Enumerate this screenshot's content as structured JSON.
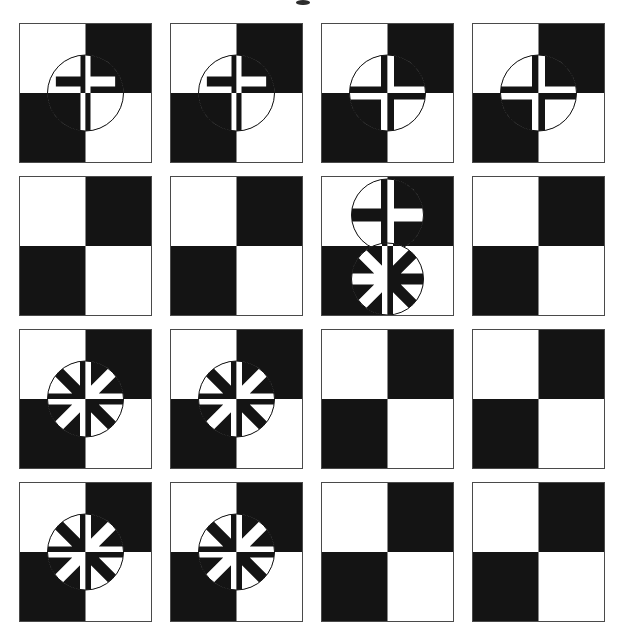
{
  "figure": {
    "width": 621,
    "height": 642,
    "background_color": "#ffffff",
    "ink_color": "#141414",
    "paper_color": "#ffffff",
    "top_mark": {
      "name": "page-edge-mark",
      "description": "small dark mark at top center edge",
      "x": 296,
      "y": 0,
      "width": 14,
      "height": 5
    },
    "grid": {
      "rows": 4,
      "columns": 4,
      "cell_width": 133,
      "cell_height": 140,
      "column_gap": 18,
      "row_gap": 13,
      "origin_x": 19,
      "origin_y": 23
    },
    "tile": {
      "description": "2x2 checkerboard: white top-left, black top-right, black bottom-left, white bottom-right",
      "quadrants": [
        "white",
        "black",
        "black",
        "white"
      ],
      "border_color": "#4a4a4a",
      "border_width": 1
    },
    "symbol_legend": [
      {
        "key": "none",
        "label": "plain checkerboard, no overlay"
      },
      {
        "key": "latin",
        "label": "circle with Latin cross (long lower stem)"
      },
      {
        "key": "greek",
        "label": "circle with Greek cross (4 equal spokes)"
      },
      {
        "key": "aster",
        "label": "circle with 8-spoke asterisk"
      }
    ],
    "cells": [
      {
        "row": 1,
        "col": 1,
        "name": "cell-r1c1",
        "symbols": [
          {
            "type": "latin",
            "cx": 66.5,
            "cy": 70,
            "r": 38,
            "spoke": 10
          }
        ]
      },
      {
        "row": 1,
        "col": 2,
        "name": "cell-r1c2",
        "symbols": [
          {
            "type": "latin",
            "cx": 66.5,
            "cy": 70,
            "r": 38,
            "spoke": 10
          }
        ]
      },
      {
        "row": 1,
        "col": 3,
        "name": "cell-r1c3",
        "symbols": [
          {
            "type": "greek",
            "cx": 66.5,
            "cy": 70,
            "r": 38,
            "spoke": 13
          }
        ]
      },
      {
        "row": 1,
        "col": 4,
        "name": "cell-r1c4",
        "symbols": [
          {
            "type": "greek",
            "cx": 66.5,
            "cy": 70,
            "r": 38,
            "spoke": 13
          }
        ]
      },
      {
        "row": 2,
        "col": 1,
        "name": "cell-r2c1",
        "symbols": []
      },
      {
        "row": 2,
        "col": 2,
        "name": "cell-r2c2",
        "symbols": []
      },
      {
        "row": 2,
        "col": 3,
        "name": "cell-r2c3",
        "symbols": [
          {
            "type": "greek",
            "cx": 66.5,
            "cy": 39,
            "r": 36,
            "spoke": 13
          },
          {
            "type": "aster",
            "cx": 66.5,
            "cy": 103,
            "r": 36,
            "spoke": 11
          }
        ]
      },
      {
        "row": 2,
        "col": 4,
        "name": "cell-r2c4",
        "symbols": []
      },
      {
        "row": 3,
        "col": 1,
        "name": "cell-r3c1",
        "symbols": [
          {
            "type": "aster",
            "cx": 66.5,
            "cy": 70,
            "r": 38,
            "spoke": 11
          }
        ]
      },
      {
        "row": 3,
        "col": 2,
        "name": "cell-r3c2",
        "symbols": [
          {
            "type": "aster",
            "cx": 66.5,
            "cy": 70,
            "r": 38,
            "spoke": 11
          }
        ]
      },
      {
        "row": 3,
        "col": 3,
        "name": "cell-r3c3",
        "symbols": []
      },
      {
        "row": 3,
        "col": 4,
        "name": "cell-r3c4",
        "symbols": []
      },
      {
        "row": 4,
        "col": 1,
        "name": "cell-r4c1",
        "symbols": [
          {
            "type": "aster",
            "cx": 66.5,
            "cy": 70,
            "r": 38,
            "spoke": 11
          }
        ]
      },
      {
        "row": 4,
        "col": 2,
        "name": "cell-r4c2",
        "symbols": [
          {
            "type": "aster",
            "cx": 66.5,
            "cy": 70,
            "r": 38,
            "spoke": 11
          }
        ]
      },
      {
        "row": 4,
        "col": 3,
        "name": "cell-r4c3",
        "symbols": []
      },
      {
        "row": 4,
        "col": 4,
        "name": "cell-r4c4",
        "symbols": []
      }
    ]
  }
}
